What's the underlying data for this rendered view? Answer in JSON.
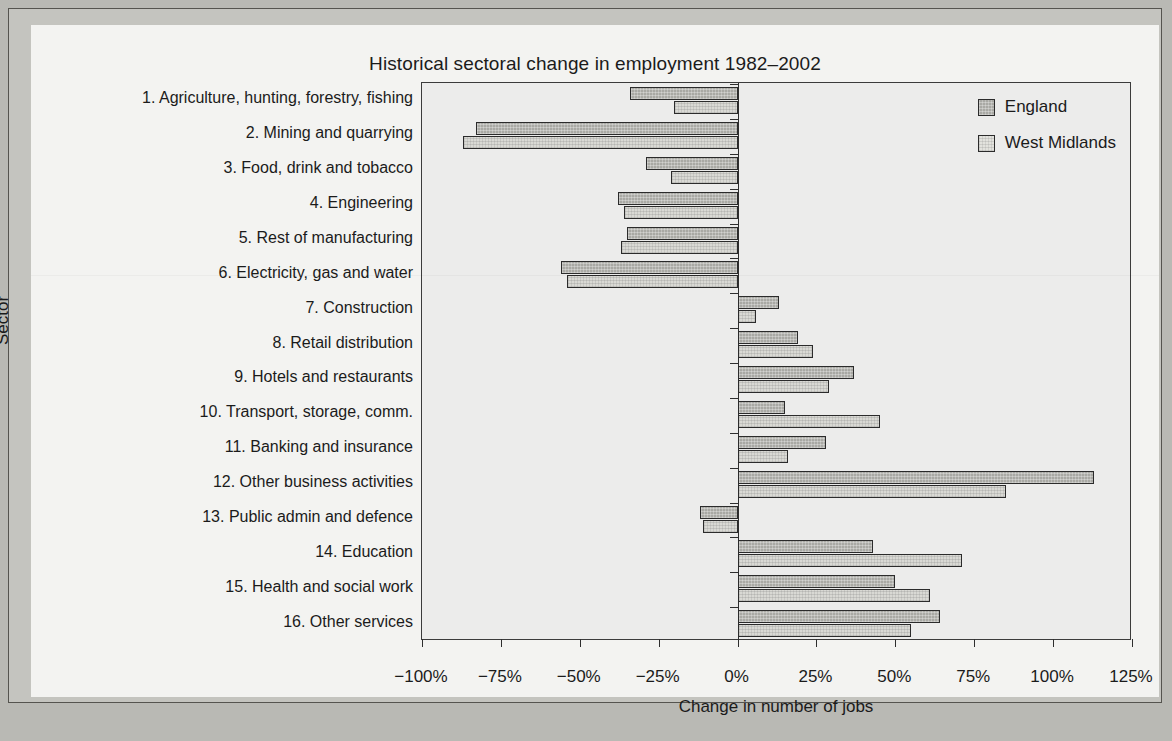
{
  "chart_data": {
    "type": "bar",
    "orientation": "horizontal",
    "title": "Historical sectoral change in employment 1982–2002",
    "xlabel": "Change in number of jobs",
    "ylabel": "Sector",
    "xlim": [
      -100,
      125
    ],
    "xticks": [
      -100,
      -75,
      -50,
      -25,
      0,
      25,
      50,
      75,
      100,
      125
    ],
    "xtick_labels": [
      "−100%",
      "−75%",
      "−50%",
      "−25%",
      "0%",
      "25%",
      "50%",
      "75%",
      "100%",
      "125%"
    ],
    "grid": false,
    "legend_position": "top-right",
    "categories": [
      "1. Agriculture, hunting, forestry, fishing",
      "2. Mining and quarrying",
      "3. Food, drink and tobacco",
      "4. Engineering",
      "5. Rest of manufacturing",
      "6. Electricity, gas and water",
      "7. Construction",
      "8. Retail distribution",
      "9. Hotels and restaurants",
      "10. Transport, storage, comm.",
      "11. Banking and insurance",
      "12. Other business activities",
      "13. Public admin and defence",
      "14. Education",
      "15. Health and social work",
      "16. Other services"
    ],
    "series": [
      {
        "name": "England",
        "color": "#a9a9a4",
        "values": [
          -34,
          -83,
          -29,
          -38,
          -35,
          -56,
          13,
          19,
          37,
          15,
          28,
          113,
          -12,
          43,
          50,
          64
        ]
      },
      {
        "name": "West Midlands",
        "color": "#d9d9d4",
        "values": [
          -20,
          -87,
          -21,
          -36,
          -37,
          -54,
          6,
          24,
          29,
          45,
          16,
          85,
          -11,
          71,
          61,
          55
        ]
      }
    ]
  }
}
